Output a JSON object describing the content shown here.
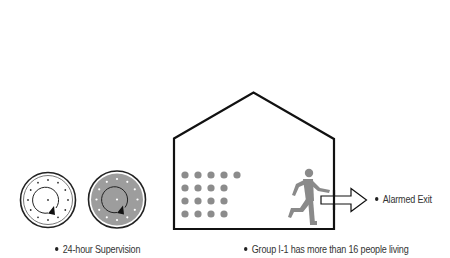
{
  "diagram": {
    "labels": {
      "supervision": "24-hour Supervision",
      "group": "Group I-1 has more than 16 people living",
      "exit": "Alarmed Exit"
    },
    "clocks": [
      {
        "name": "clock-light",
        "fill": "#ffffff",
        "marks": "#333333"
      },
      {
        "name": "clock-dark",
        "fill": "#9a9a9a",
        "marks": "#ffffff"
      }
    ],
    "occupants": {
      "rows": [
        5,
        4,
        4,
        4
      ],
      "color": "#8c8c8c"
    },
    "figure_color": "#8a8a8a",
    "outline_color": "#111111"
  }
}
